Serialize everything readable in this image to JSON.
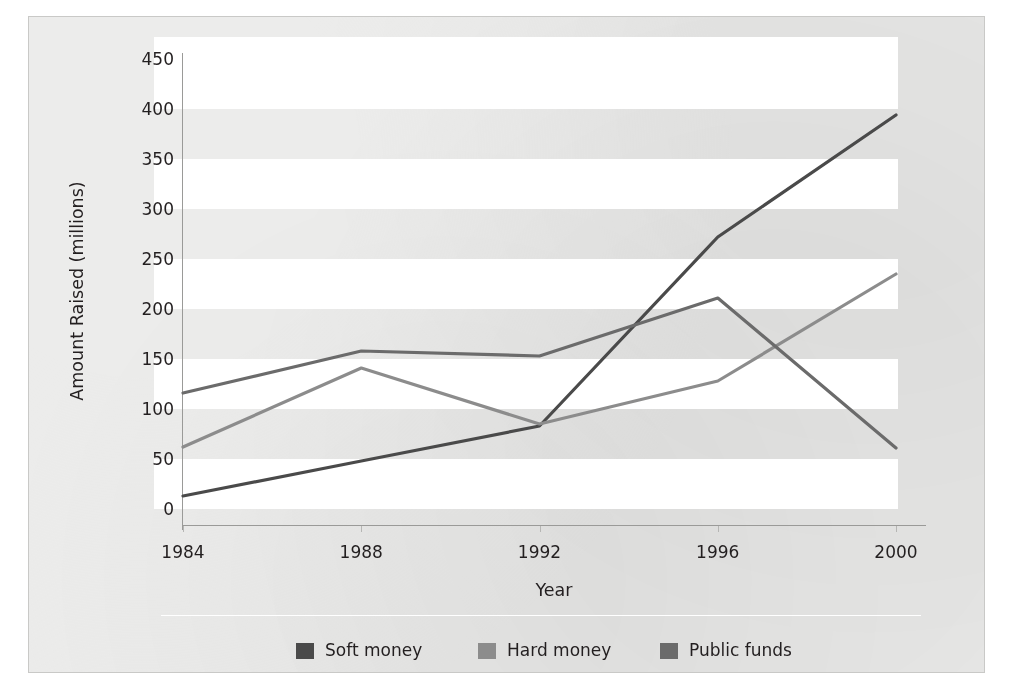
{
  "chart_data": {
    "type": "line",
    "title": "",
    "xlabel": "Year",
    "ylabel": "Amount Raised (millions)",
    "categories": [
      "1984",
      "1988",
      "1992",
      "1996",
      "2000"
    ],
    "x": [
      1984,
      1988,
      1992,
      1996,
      2000
    ],
    "xlim": [
      1984,
      2000
    ],
    "ylim": [
      0,
      450
    ],
    "y_ticks": [
      0,
      50,
      100,
      150,
      200,
      250,
      300,
      350,
      400,
      450
    ],
    "y_tick_labels": [
      "0",
      "50",
      "100",
      "150",
      "200",
      "250",
      "300",
      "350",
      "400",
      "450"
    ],
    "grid": false,
    "banded_background": true,
    "legend_position": "bottom",
    "series": [
      {
        "name": "Soft money",
        "color": "#4a4a4a",
        "values": [
          13,
          48,
          83,
          272,
          394
        ]
      },
      {
        "name": "Hard money",
        "color": "#8c8c8c",
        "values": [
          62,
          141,
          85,
          128,
          235
        ]
      },
      {
        "name": "Public funds",
        "color": "#6b6b6b",
        "values": [
          116,
          158,
          153,
          211,
          61
        ]
      }
    ]
  },
  "legend": {
    "items": [
      {
        "label": "Soft money",
        "color": "#4a4a4a"
      },
      {
        "label": "Hard money",
        "color": "#8c8c8c"
      },
      {
        "label": "Public funds",
        "color": "#6b6b6b"
      }
    ]
  },
  "style": {
    "card_background": "#ececeb",
    "band_color": "#ffffff",
    "axis_color": "#9a9a98",
    "text_color": "#231f20"
  }
}
